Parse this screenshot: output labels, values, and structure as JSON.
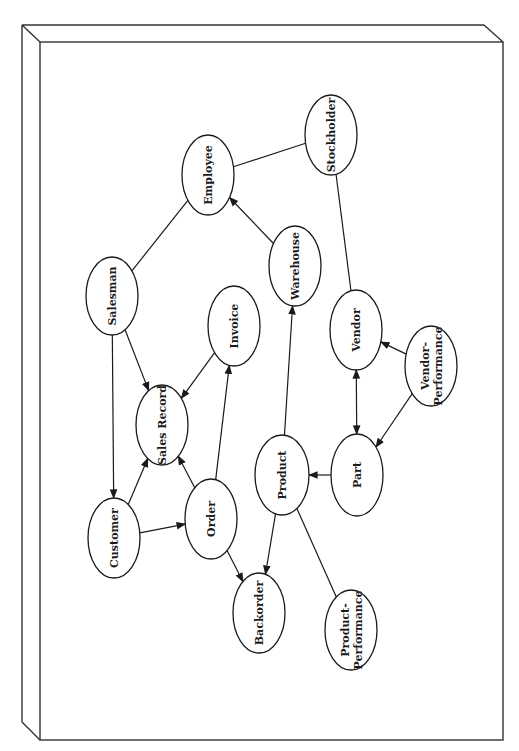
{
  "diagram": {
    "type": "entity-relationship",
    "orientation": "rotated-90-ccw",
    "frame": {
      "style": "3d-panel",
      "outer": {
        "left": 22,
        "top": 25,
        "right": 484,
        "bottom": 722
      },
      "inner": {
        "left": 40,
        "top": 42,
        "right": 503,
        "bottom": 740
      },
      "stroke_color": "#333333"
    },
    "nodes": [
      {
        "id": "employee",
        "label": [
          "Employee"
        ],
        "cx": 208,
        "cy": 175,
        "rx": 26,
        "ry": 40
      },
      {
        "id": "stockholder",
        "label": [
          "Stockholder"
        ],
        "cx": 331,
        "cy": 135,
        "rx": 26,
        "ry": 40
      },
      {
        "id": "salesman",
        "label": [
          "Salesman"
        ],
        "cx": 112,
        "cy": 296,
        "rx": 26,
        "ry": 39
      },
      {
        "id": "warehouse",
        "label": [
          "Warehouse"
        ],
        "cx": 295,
        "cy": 266,
        "rx": 26,
        "ry": 40
      },
      {
        "id": "invoice",
        "label": [
          "Invoice"
        ],
        "cx": 234,
        "cy": 326,
        "rx": 26,
        "ry": 40
      },
      {
        "id": "vendor",
        "label": [
          "Vendor"
        ],
        "cx": 356,
        "cy": 330,
        "rx": 26,
        "ry": 40
      },
      {
        "id": "vendor-performance",
        "label": [
          "Vendor-",
          "Performance"
        ],
        "cx": 431,
        "cy": 366,
        "rx": 26,
        "ry": 40
      },
      {
        "id": "sales-record",
        "label": [
          "Sales Record"
        ],
        "cx": 162,
        "cy": 425,
        "rx": 26,
        "ry": 40
      },
      {
        "id": "product",
        "label": [
          "Product"
        ],
        "cx": 282,
        "cy": 475,
        "rx": 27,
        "ry": 40
      },
      {
        "id": "part",
        "label": [
          "Part"
        ],
        "cx": 357,
        "cy": 475,
        "rx": 26,
        "ry": 41
      },
      {
        "id": "customer",
        "label": [
          "Customer"
        ],
        "cx": 114,
        "cy": 538,
        "rx": 26,
        "ry": 40
      },
      {
        "id": "order",
        "label": [
          "Order"
        ],
        "cx": 211,
        "cy": 519,
        "rx": 26,
        "ry": 40
      },
      {
        "id": "backorder",
        "label": [
          "Backorder"
        ],
        "cx": 259,
        "cy": 613,
        "rx": 26,
        "ry": 40
      },
      {
        "id": "product-performance",
        "label": [
          "Product-",
          "Performance"
        ],
        "cx": 351,
        "cy": 630,
        "rx": 26,
        "ry": 40
      }
    ],
    "edges": [
      {
        "from": "salesman",
        "to": "employee",
        "arrow": "none"
      },
      {
        "from": "employee",
        "to": "stockholder",
        "arrow": "none"
      },
      {
        "from": "warehouse",
        "to": "employee",
        "arrow": "end"
      },
      {
        "from": "stockholder",
        "to": "vendor",
        "arrow": "none"
      },
      {
        "from": "salesman",
        "to": "sales-record",
        "arrow": "end"
      },
      {
        "from": "salesman",
        "to": "customer",
        "arrow": "end"
      },
      {
        "from": "invoice",
        "to": "sales-record",
        "arrow": "end"
      },
      {
        "from": "customer",
        "to": "sales-record",
        "arrow": "end"
      },
      {
        "from": "order",
        "to": "sales-record",
        "arrow": "end"
      },
      {
        "from": "order",
        "to": "invoice",
        "arrow": "end"
      },
      {
        "from": "customer",
        "to": "order",
        "arrow": "end"
      },
      {
        "from": "order",
        "to": "backorder",
        "arrow": "end"
      },
      {
        "from": "product",
        "to": "backorder",
        "arrow": "end"
      },
      {
        "from": "product",
        "to": "warehouse",
        "arrow": "end"
      },
      {
        "from": "product",
        "to": "product-performance",
        "arrow": "none"
      },
      {
        "from": "part",
        "to": "product",
        "arrow": "end"
      },
      {
        "from": "vendor",
        "to": "part",
        "arrow": "both"
      },
      {
        "from": "vendor-performance",
        "to": "vendor",
        "arrow": "end"
      },
      {
        "from": "vendor-performance",
        "to": "part",
        "arrow": "end"
      }
    ]
  }
}
